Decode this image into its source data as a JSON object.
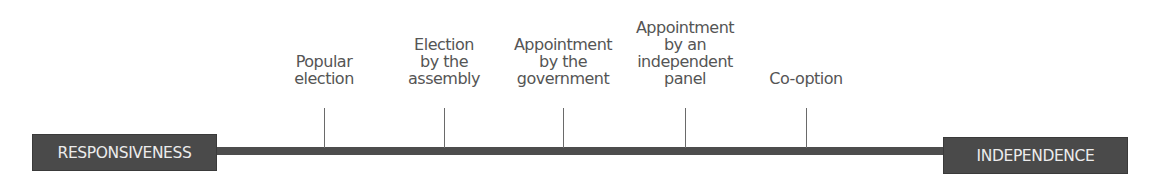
{
  "diagram": {
    "left_end": "RESPONSIVENESS",
    "right_end": "INDEPENDENCE",
    "points": [
      {
        "x": 324,
        "lines": [
          "Popular",
          "election"
        ]
      },
      {
        "x": 444,
        "lines": [
          "Election",
          "by the",
          "assembly"
        ]
      },
      {
        "x": 563,
        "lines": [
          "Appointment",
          "by the",
          "government"
        ]
      },
      {
        "x": 685,
        "lines": [
          "Appointment",
          "by an",
          "independent",
          "panel"
        ]
      },
      {
        "x": 806,
        "lines": [
          "Co-option"
        ]
      }
    ]
  },
  "colors": {
    "box_fill": "#4a4a4a",
    "box_text": "#ececec",
    "axis": "#4d4d4d",
    "label_text": "#555555"
  }
}
